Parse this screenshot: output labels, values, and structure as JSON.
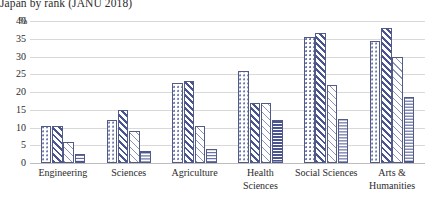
{
  "chart_data": {
    "type": "bar",
    "title": "Japan by rank (JANU 2018)",
    "xlabel": "",
    "ylabel": "%",
    "ylim": [
      0,
      40
    ],
    "ytick_values": [
      0,
      5,
      10,
      15,
      20,
      25,
      30,
      35,
      40
    ],
    "ytick_labels": [
      "0",
      "5",
      "10",
      "15",
      "20",
      "25",
      "30",
      "35",
      "40"
    ],
    "y_unit_label": "%",
    "grid": true,
    "legend": "none",
    "categories": [
      "Engineering",
      "Sciences",
      "Agriculture",
      "Health Sciences",
      "Social Sciences",
      "Arts & Humanities"
    ],
    "category_lines": [
      [
        "Engineering"
      ],
      [
        "Sciences"
      ],
      [
        "Agriculture"
      ],
      [
        "Health",
        "Sciences"
      ],
      [
        "Social Sciences"
      ],
      [
        "Arts &",
        "Humanities"
      ]
    ],
    "series": [
      {
        "name": "series-1",
        "pattern": "dots",
        "values": [
          10.5,
          12.0,
          22.5,
          26.0,
          35.5,
          34.5
        ]
      },
      {
        "name": "series-2",
        "pattern": "diagonal-dense",
        "values": [
          10.5,
          15.0,
          23.0,
          17.0,
          36.5,
          38.0
        ]
      },
      {
        "name": "series-3",
        "pattern": "diagonal-light",
        "values": [
          6.0,
          9.0,
          10.5,
          17.0,
          22.0,
          30.0
        ]
      },
      {
        "name": "series-4",
        "pattern": "horizontal-lines",
        "values": [
          2.5,
          3.5,
          4.0,
          12.0,
          12.5,
          18.5
        ]
      }
    ],
    "colors": {
      "bar_outline": "#515b86",
      "pattern_dark": "#4a5490",
      "pattern_light": "#8a93bb",
      "gridline": "#d9d9d9",
      "axis": "#bdbdbd",
      "text": "#2b2b2b",
      "background": "#ffffff"
    }
  }
}
